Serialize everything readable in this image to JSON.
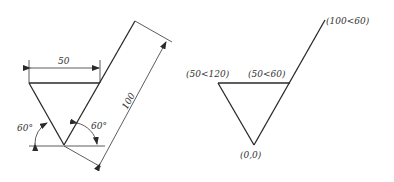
{
  "left_figure": {
    "dimension_width": "50",
    "dimension_length": "100",
    "angle_left": "60°",
    "angle_right": "60°"
  },
  "right_figure": {
    "point_origin": "(0,0)",
    "point_left": "(50<120)",
    "point_right": "(50<60)",
    "point_end": "(100<60)"
  }
}
